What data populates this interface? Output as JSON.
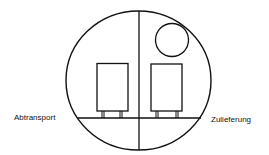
{
  "diagram": {
    "labels": {
      "left": "Abtransport",
      "right": "Zulieferung"
    },
    "colors": {
      "stroke": "#111111",
      "background": "#ffffff"
    }
  }
}
